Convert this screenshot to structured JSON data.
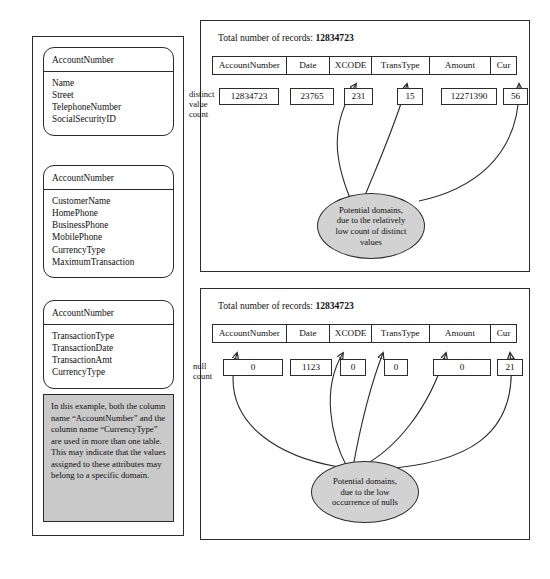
{
  "left_column": {
    "entities": [
      {
        "title": "AccountNumber",
        "attributes": [
          "Name",
          "Street",
          "TelephoneNumber",
          "SocialSecurityID"
        ]
      },
      {
        "title": "AccountNumber",
        "attributes": [
          "CustomerName",
          "HomePhone",
          "BusinessPhone",
          "MobilePhone",
          "CurrencyType",
          "MaximumTransaction"
        ]
      },
      {
        "title": "AccountNumber",
        "attributes": [
          "TransactionType",
          "TransactionDate",
          "TransactionAmt",
          "CurrencyType"
        ]
      }
    ],
    "note": "In this example, both the column name “AccountNumber” and the column name “CurrencyType” are used in more than one table. This may indicate that the values assigned to these attributes may belong to a specific domain."
  },
  "panels": [
    {
      "heading_label": "Total number of records:",
      "heading_value": "12834723",
      "row_label": "distinct\nvalue\ncount",
      "row_label_lines": [
        "distinct",
        "value",
        "count"
      ],
      "columns": [
        "AccountNumber",
        "Date",
        "XCODE",
        "TransType",
        "Amount",
        "Cur"
      ],
      "values": [
        "12834723",
        "23765",
        "231",
        "15",
        "12271390",
        "56"
      ],
      "bubble_text": "Potential domains, due to the relatively low count of distinct values",
      "bubble_lines": [
        "Potential domains,",
        "due to the relatively",
        "low count of distinct",
        "values"
      ],
      "highlighted_columns": [
        "XCODE",
        "TransType",
        "Cur"
      ]
    },
    {
      "heading_label": "Total number of records:",
      "heading_value": "12834723",
      "row_label": "null\ncount",
      "row_label_lines": [
        "null",
        "count"
      ],
      "columns": [
        "AccountNumber",
        "Date",
        "XCODE",
        "TransType",
        "Amount",
        "Cur"
      ],
      "values": [
        "0",
        "1123",
        "0",
        "0",
        "0",
        "21"
      ],
      "bubble_text": "Potential domains, due to the low occurrence of nulls",
      "bubble_lines": [
        "Potential domains,",
        "due to the low",
        "occurrence of nulls"
      ],
      "highlighted_columns": [
        "AccountNumber",
        "XCODE",
        "TransType",
        "Amount",
        "Cur"
      ]
    }
  ],
  "colors": {
    "stroke": "#2b2b2b",
    "note_fill": "#c9c9c9",
    "bubble_fill": "#d2d2d2",
    "page_bg": "#ffffff"
  }
}
